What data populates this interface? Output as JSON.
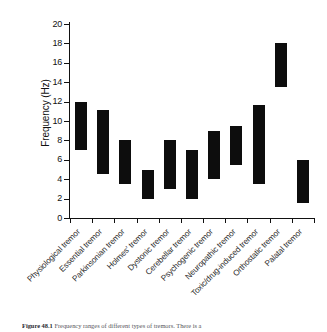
{
  "figure": {
    "caption_label": "Figure 48.1",
    "caption_text": "Frequency ranges of different types of tremors. There is a"
  },
  "chart_data": {
    "type": "bar",
    "subtype": "floating-range-bar",
    "title": "",
    "xlabel": "",
    "ylabel": "Frequency (Hz)",
    "ylim": [
      0,
      20
    ],
    "ytick_step": 2,
    "yticks": [
      20,
      18,
      16,
      14,
      12,
      10,
      8,
      6,
      4,
      2,
      0
    ],
    "grid": false,
    "legend": false,
    "bar_color": "#0d0d0d",
    "axis_color": "#111111",
    "categories": [
      "Physiological tremor",
      "Essential tremor",
      "Parkinsonian tremor",
      "Holmes' tremor",
      "Dystonic tremor",
      "Cerebellar tremor",
      "Psychogenic tremor",
      "Neuropathic tremor",
      "Toxic/drug-induced tremor",
      "Orthostatic tremor",
      "Palatal tremor"
    ],
    "series": [
      {
        "name": "Low frequency (Hz)",
        "values": [
          7.0,
          4.5,
          3.5,
          2.0,
          3.0,
          2.0,
          4.0,
          5.5,
          3.5,
          13.5,
          1.5
        ]
      },
      {
        "name": "High frequency (Hz)",
        "values": [
          12.0,
          11.1,
          8.0,
          5.0,
          8.0,
          7.0,
          9.0,
          9.5,
          11.6,
          18.0,
          6.0
        ]
      }
    ],
    "ranges": [
      {
        "category": "Physiological tremor",
        "low": 7.0,
        "high": 12.0
      },
      {
        "category": "Essential tremor",
        "low": 4.5,
        "high": 11.1
      },
      {
        "category": "Parkinsonian tremor",
        "low": 3.5,
        "high": 8.0
      },
      {
        "category": "Holmes' tremor",
        "low": 2.0,
        "high": 5.0
      },
      {
        "category": "Dystonic tremor",
        "low": 3.0,
        "high": 8.0
      },
      {
        "category": "Cerebellar tremor",
        "low": 2.0,
        "high": 7.0
      },
      {
        "category": "Psychogenic tremor",
        "low": 4.0,
        "high": 9.0
      },
      {
        "category": "Neuropathic tremor",
        "low": 5.5,
        "high": 9.5
      },
      {
        "category": "Toxic/drug-induced tremor",
        "low": 3.5,
        "high": 11.6
      },
      {
        "category": "Orthostatic tremor",
        "low": 13.5,
        "high": 18.0
      },
      {
        "category": "Palatal tremor",
        "low": 1.5,
        "high": 6.0
      }
    ]
  }
}
